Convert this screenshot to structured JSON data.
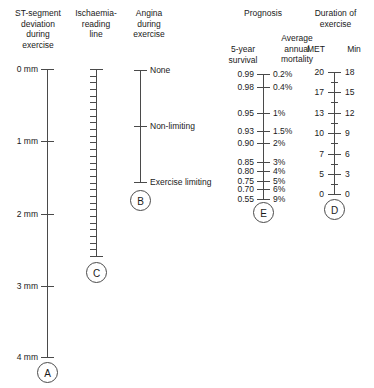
{
  "figure": {
    "type": "nomogram",
    "title": "",
    "background": "#ffffff",
    "line_color": "#4a4a4a",
    "text_color": "#1a1a1a"
  },
  "columns": {
    "st_segment": {
      "header": "ST-segment\ndeviation\nduring\nexercise",
      "key": "A",
      "axis_top_px": 69,
      "axis_bottom_px": 357,
      "ticks": [
        {
          "label": "0 mm",
          "y": 69
        },
        {
          "label": "1 mm",
          "y": 141
        },
        {
          "label": "2 mm",
          "y": 214
        },
        {
          "label": "3 mm",
          "y": 286
        },
        {
          "label": "4 mm",
          "y": 357
        }
      ]
    },
    "ischaemia": {
      "header": "Ischaemia-\nreading\nline",
      "key": "C",
      "axis_top_px": 69,
      "axis_bottom_px": 256,
      "minor_tick_count": 28
    },
    "angina": {
      "header": "Angina\nduring\nexercise",
      "key": "B",
      "axis_top_px": 70,
      "axis_bottom_px": 182,
      "ticks": [
        {
          "label": "None",
          "y": 70
        },
        {
          "label": "Non-limiting",
          "y": 126
        },
        {
          "label": "Exercise limiting",
          "y": 182
        }
      ]
    },
    "prognosis": {
      "header": "Prognosis",
      "key": "E",
      "left_subheader": "5-year\nsurvival",
      "right_subheader": "Average\nannual\nmortality",
      "axis_top_px": 74,
      "axis_bottom_px": 199,
      "ticks": [
        {
          "survival": "0.99",
          "mortality": "0.2%",
          "y": 74
        },
        {
          "survival": "0.98",
          "mortality": "0.4%",
          "y": 87
        },
        {
          "survival": "0.95",
          "mortality": "1%",
          "y": 113
        },
        {
          "survival": "0.93",
          "mortality": "1.5%",
          "y": 131
        },
        {
          "survival": "0.90",
          "mortality": "2%",
          "y": 143
        },
        {
          "survival": "0.85",
          "mortality": "3%",
          "y": 162
        },
        {
          "survival": "0.80",
          "mortality": "4%",
          "y": 171
        },
        {
          "survival": "0.75",
          "mortality": "5%",
          "y": 181
        },
        {
          "survival": "0.70",
          "mortality": "6%",
          "y": 189
        },
        {
          "survival": "0.55",
          "mortality": "9%",
          "y": 199
        }
      ]
    },
    "duration": {
      "header": "Duration of\nexercise",
      "key": "D",
      "left_subheader": "MET",
      "right_subheader": "Min",
      "axis_top_px": 72,
      "axis_bottom_px": 194,
      "ticks": [
        {
          "met": "20",
          "min": "18",
          "y": 72
        },
        {
          "met": "17",
          "min": "15",
          "y": 92
        },
        {
          "met": "13",
          "min": "12",
          "y": 113
        },
        {
          "met": "10",
          "min": "9",
          "y": 133
        },
        {
          "met": "7",
          "min": "6",
          "y": 154
        },
        {
          "met": "5",
          "min": "3",
          "y": 174
        },
        {
          "met": "0",
          "min": "0",
          "y": 194
        }
      ],
      "minor_ticks_y": [
        82,
        102,
        123,
        143,
        164,
        184
      ]
    }
  },
  "chart_data": {
    "type": "nomogram",
    "scales": [
      {
        "key": "A",
        "name": "ST-segment deviation during exercise",
        "unit": "mm",
        "values": [
          0,
          1,
          2,
          3,
          4
        ],
        "tick_labels": [
          "0 mm",
          "1 mm",
          "2 mm",
          "3 mm",
          "4 mm"
        ],
        "orientation": "vertical",
        "direction": "top-to-bottom increasing"
      },
      {
        "key": "C",
        "name": "Ischaemia-reading line",
        "unit": "",
        "tick_labels": [],
        "minor_tick_count": 28,
        "orientation": "vertical",
        "note": "unlabelled graduated reading line"
      },
      {
        "key": "B",
        "name": "Angina during exercise",
        "unit": "",
        "tick_labels": [
          "None",
          "Non-limiting",
          "Exercise limiting"
        ],
        "orientation": "vertical",
        "direction": "top-to-bottom increasing severity"
      },
      {
        "key": "E",
        "name": "Prognosis",
        "left_axis_name": "5-year survival",
        "right_axis_name": "Average annual mortality",
        "left_tick_labels": [
          "0.99",
          "0.98",
          "0.95",
          "0.93",
          "0.90",
          "0.85",
          "0.80",
          "0.75",
          "0.70",
          "0.55"
        ],
        "right_tick_labels": [
          "0.2%",
          "0.4%",
          "1%",
          "1.5%",
          "2%",
          "3%",
          "4%",
          "5%",
          "6%",
          "9%"
        ],
        "orientation": "vertical",
        "direction": "survival decreasing downward"
      },
      {
        "key": "D",
        "name": "Duration of exercise",
        "left_axis_name": "MET",
        "right_axis_name": "Min",
        "left_tick_labels": [
          "20",
          "17",
          "13",
          "10",
          "7",
          "5",
          "0"
        ],
        "right_tick_labels": [
          "18",
          "15",
          "12",
          "9",
          "6",
          "3",
          "0"
        ],
        "orientation": "vertical",
        "direction": "decreasing downward"
      }
    ]
  }
}
